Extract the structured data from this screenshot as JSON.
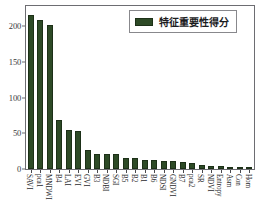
{
  "chart_data": {
    "type": "bar",
    "title": "",
    "xlabel": "",
    "ylabel": "",
    "ylim": [
      0,
      228
    ],
    "grid": false,
    "legend_position": "upper-right",
    "series_name": "特征重要性得分",
    "bar_color": "#2d4a26",
    "edge_color": "#1d3018",
    "yticks": [
      0,
      50,
      100,
      150,
      200
    ],
    "ytick_labels": [
      "0",
      "50",
      "100",
      "150",
      "200"
    ],
    "categories": [
      "SAVI",
      "pca1",
      "MNDWI",
      "B4",
      "LAI",
      "EVI",
      "GVI",
      "B3",
      "NDBI",
      "SGI",
      "B5",
      "B2",
      "B1",
      "B6",
      "NDSI",
      "GNDVI",
      "B7",
      "pca2",
      "SR",
      "NDVI",
      "Entropy",
      "Asm",
      "Con",
      "Hom"
    ],
    "values": [
      215,
      209,
      201,
      69,
      55,
      53,
      26,
      21,
      21,
      21,
      16,
      15,
      13,
      12,
      11,
      11,
      10,
      9,
      5,
      4,
      4,
      3,
      3,
      3
    ]
  },
  "legend": {
    "label": "特征重要性得分"
  }
}
